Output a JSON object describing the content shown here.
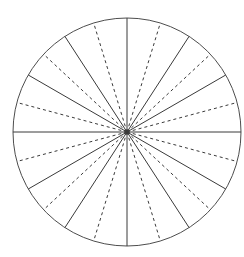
{
  "figure": {
    "type": "geometric-diagram",
    "background_color": "#ffffff",
    "canvas": {
      "width": 244,
      "height": 257
    }
  },
  "chart_data": {
    "type": "pie",
    "title": "",
    "xlabel": "",
    "ylabel": "",
    "legend": [],
    "grid": false,
    "circle": {
      "center_x": 127,
      "center_y": 132,
      "radius_x": 114,
      "radius_y": 114,
      "stroke_color": "#4d4d4d",
      "stroke_width": 1,
      "fill": "none"
    },
    "solid_radii_deg": [
      0,
      30,
      57,
      90,
      123,
      150,
      180,
      210,
      237,
      270,
      303,
      330
    ],
    "dashed_radii_deg": [
      15,
      43,
      73,
      107,
      137,
      165,
      195,
      223,
      253,
      287,
      317,
      345
    ],
    "solid_style": {
      "stroke_color": "#3a3a3a",
      "stroke_width": 1,
      "dash": "none"
    },
    "dashed_style": {
      "stroke_color": "#3a3a3a",
      "stroke_width": 1,
      "dash": "3,3"
    },
    "categories": [
      "sector-1",
      "sector-2",
      "sector-3",
      "sector-4",
      "sector-5",
      "sector-6",
      "sector-7",
      "sector-8",
      "sector-9",
      "sector-10",
      "sector-11",
      "sector-12"
    ],
    "values": [
      30,
      27,
      33,
      33,
      27,
      30,
      30,
      27,
      33,
      33,
      27,
      30
    ]
  }
}
